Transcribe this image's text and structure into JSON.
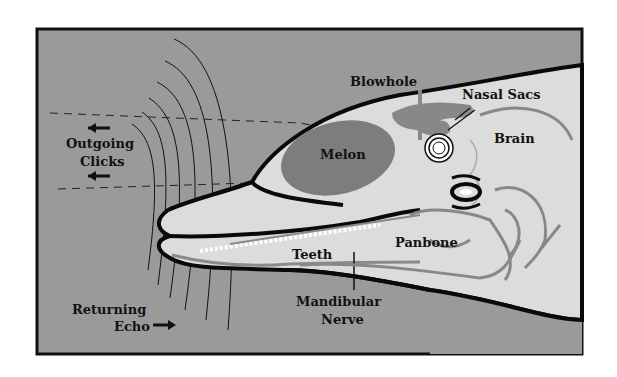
{
  "diagram": {
    "colors": {
      "water": "#9a9a9a",
      "head": "#dcdcdc",
      "melon": "#7d7d7d",
      "anatomy_lines": "#888888",
      "outline": "#0a0a0a",
      "frame": "#111111"
    },
    "labels": {
      "outgoing_line1": "Outgoing",
      "outgoing_line2": "Clicks",
      "returning_line1": "Returning",
      "returning_line2": "Echo",
      "melon": "Melon",
      "blowhole": "Blowhole",
      "nasal_sacs": "Nasal Sacs",
      "brain": "Brain",
      "panbone": "Panbone",
      "teeth": "Teeth",
      "mandibular_line1": "Mandibular",
      "mandibular_line2": "Nerve"
    },
    "arrows": {
      "outgoing_direction": "left",
      "returning_direction": "right"
    }
  }
}
